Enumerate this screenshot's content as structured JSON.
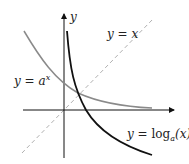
{
  "diagram": {
    "axes": {
      "x_label": "",
      "y_label": "y"
    },
    "curves": [
      {
        "name": "exponential",
        "label_lhs": "y",
        "label_eq": "=",
        "label_base": "a",
        "label_exp": "x",
        "color": "#8a8a8a"
      },
      {
        "name": "logarithm",
        "label_lhs": "y",
        "label_eq": "=",
        "label_fn": "log",
        "label_base": "a",
        "label_arg": "(x)",
        "color": "#111111"
      },
      {
        "name": "identity",
        "label": "y = x",
        "color": "#aaaaaa",
        "dashed": true
      }
    ]
  }
}
